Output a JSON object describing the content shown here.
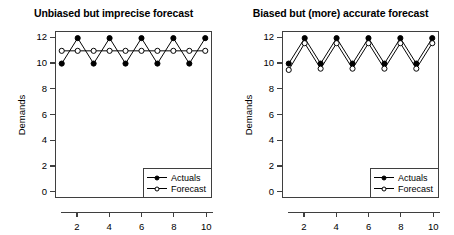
{
  "figure": {
    "ylabel": "Demands",
    "legend": {
      "actuals_label": "Actuals",
      "forecast_label": "Forecast"
    }
  },
  "chart_data": [
    {
      "type": "line",
      "title": "Unbiased but imprecise forecast",
      "xlabel": "",
      "ylabel": "Demands",
      "x": [
        1,
        2,
        3,
        4,
        5,
        6,
        7,
        8,
        9,
        10
      ],
      "xlim": [
        0.64,
        10.36
      ],
      "ylim": [
        -0.48,
        12.48
      ],
      "xticks": [
        2,
        4,
        6,
        8,
        10
      ],
      "yticks": [
        0,
        2,
        4,
        6,
        8,
        10,
        12
      ],
      "grid": false,
      "legend_position": "bottom-right",
      "series": [
        {
          "name": "Actuals",
          "marker": "filled-circle",
          "color": "#000000",
          "values": [
            10,
            12,
            10,
            12,
            10,
            12,
            10,
            12,
            10,
            12
          ]
        },
        {
          "name": "Forecast",
          "marker": "open-circle",
          "color": "#000000",
          "values": [
            11,
            11,
            11,
            11,
            11,
            11,
            11,
            11,
            11,
            11
          ]
        }
      ]
    },
    {
      "type": "line",
      "title": "Biased but (more) accurate forecast",
      "xlabel": "",
      "ylabel": "Demands",
      "x": [
        1,
        2,
        3,
        4,
        5,
        6,
        7,
        8,
        9,
        10
      ],
      "xlim": [
        0.64,
        10.36
      ],
      "ylim": [
        -0.48,
        12.48
      ],
      "xticks": [
        2,
        4,
        6,
        8,
        10
      ],
      "yticks": [
        0,
        2,
        4,
        6,
        8,
        10,
        12
      ],
      "grid": false,
      "legend_position": "bottom-right",
      "series": [
        {
          "name": "Actuals",
          "marker": "filled-circle",
          "color": "#000000",
          "values": [
            10,
            12,
            10,
            12,
            10,
            12,
            10,
            12,
            10,
            12
          ]
        },
        {
          "name": "Forecast",
          "marker": "open-circle",
          "color": "#000000",
          "values": [
            9.5,
            11.6,
            9.6,
            11.6,
            9.6,
            11.6,
            9.6,
            11.6,
            9.6,
            11.6
          ]
        }
      ]
    }
  ]
}
